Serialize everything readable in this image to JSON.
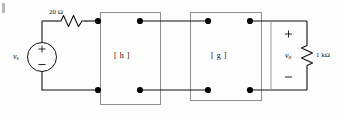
{
  "diagram": {
    "corner_mark": "",
    "source": {
      "label": "v",
      "label_sub": "s",
      "plus": "+",
      "minus": "−"
    },
    "series_resistor": {
      "value": "20 Ω"
    },
    "block_h": {
      "label": "[ h ]"
    },
    "block_g": {
      "label": "[ g ]"
    },
    "output": {
      "plus": "+",
      "minus": "−",
      "label": "v",
      "label_sub": "o",
      "resistor_value": "1 kΩ"
    }
  },
  "colors": {
    "wire": "#111111",
    "box_outline": "#8f8f8f",
    "node_dot": "#000000",
    "background": "#fdfdfd",
    "text": "#111111"
  }
}
